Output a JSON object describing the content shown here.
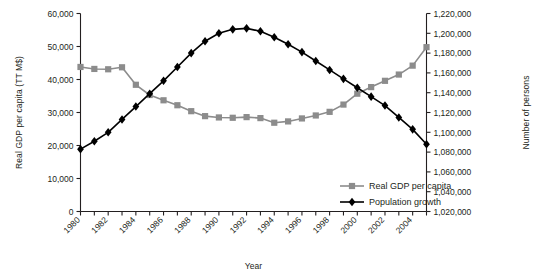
{
  "chart_data": {
    "type": "line",
    "title": "",
    "xlabel": "Year",
    "ylabel": "Real GDP per capita (TT M$)",
    "y2label": "Number of persons",
    "grid": false,
    "legend_position": "inside-bottom-right",
    "x": [
      1980,
      1981,
      1982,
      1983,
      1984,
      1985,
      1986,
      1987,
      1988,
      1989,
      1990,
      1991,
      1992,
      1993,
      1994,
      1995,
      1996,
      1997,
      1998,
      1999,
      2000,
      2001,
      2002,
      2003,
      2004,
      2005
    ],
    "xtick_labels": [
      "1980",
      "1982",
      "1984",
      "1986",
      "1988",
      "1990",
      "1992",
      "1994",
      "1996",
      "1998",
      "2000",
      "2002",
      "2004"
    ],
    "xtick_values": [
      1980,
      1982,
      1984,
      1986,
      1988,
      1990,
      1992,
      1994,
      1996,
      1998,
      2000,
      2002,
      2004
    ],
    "xlim": [
      1980,
      2005
    ],
    "ylim": [
      0,
      60000
    ],
    "ytick_labels": [
      "0",
      "10,000",
      "20,000",
      "30,000",
      "40,000",
      "50,000",
      "60,000"
    ],
    "ytick_values": [
      0,
      10000,
      20000,
      30000,
      40000,
      50000,
      60000
    ],
    "y2lim": [
      1020000,
      1220000
    ],
    "y2tick_labels": [
      "1,020,000",
      "1,040,000",
      "1,060,000",
      "1,080,000",
      "1,100,000",
      "1,120,000",
      "1,140,000",
      "1,160,000",
      "1,180,000",
      "1,200,000",
      "1,220,000"
    ],
    "y2tick_values": [
      1020000,
      1040000,
      1060000,
      1080000,
      1100000,
      1120000,
      1140000,
      1160000,
      1180000,
      1200000,
      1220000
    ],
    "series": [
      {
        "name": "Real GDP per capita",
        "axis": "left",
        "color": "#8c8c8c",
        "marker": "square",
        "values": [
          43800,
          43200,
          43100,
          43700,
          38400,
          35300,
          33700,
          32200,
          30400,
          28900,
          28500,
          28400,
          28600,
          28300,
          26900,
          27300,
          28200,
          29100,
          30200,
          32400,
          35700,
          37700,
          39600,
          41500,
          44200,
          49800
        ]
      },
      {
        "name": "Population growth",
        "axis": "right",
        "color": "#000000",
        "marker": "diamond",
        "values": [
          1083000,
          1091000,
          1100000,
          1113000,
          1126000,
          1139000,
          1152000,
          1166000,
          1180000,
          1192000,
          1200000,
          1204000,
          1205000,
          1202000,
          1196000,
          1189000,
          1181000,
          1172000,
          1163000,
          1154000,
          1145000,
          1136000,
          1127000,
          1115000,
          1103000,
          1088000
        ]
      }
    ]
  },
  "legend": {
    "items": [
      {
        "label": "Real GDP per capita",
        "color": "#8c8c8c",
        "marker": "square"
      },
      {
        "label": "Population growth",
        "color": "#000000",
        "marker": "diamond"
      }
    ]
  }
}
